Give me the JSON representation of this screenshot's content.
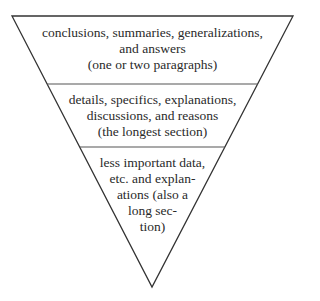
{
  "diagram": {
    "type": "inverted-pyramid",
    "colors": {
      "stroke": "#333333",
      "text": "#2a2a2a",
      "background": "#ffffff"
    },
    "sections": [
      {
        "lines": [
          "conclusions, summaries, generalizations,",
          "and answers",
          "(one or two paragraphs)"
        ]
      },
      {
        "lines": [
          "details, specifics, explanations,",
          "discussions, and reasons",
          "(the longest section)"
        ]
      },
      {
        "lines": [
          "less important data,",
          "etc. and explan-",
          "ations (also a",
          "long sec-",
          "tion)"
        ]
      }
    ]
  }
}
